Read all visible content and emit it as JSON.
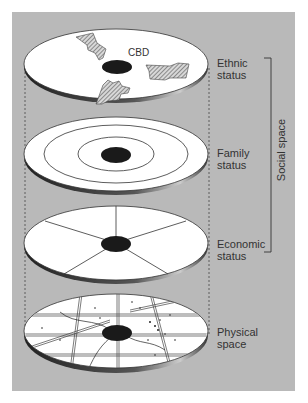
{
  "diagram": {
    "layers": [
      {
        "id": "ethnic",
        "label_line1": "Ethnic",
        "label_line2": "status",
        "center_label": "CBD"
      },
      {
        "id": "family",
        "label_line1": "Family",
        "label_line2": "status"
      },
      {
        "id": "economic",
        "label_line1": "Economic",
        "label_line2": "status"
      },
      {
        "id": "physical",
        "label_line1": "Physical",
        "label_line2": "space"
      }
    ],
    "bracket_label": "Social space",
    "colors": {
      "background": "#b9b9b9",
      "disc": "#ffffff",
      "cbd": "#1a1a1a",
      "line": "#333333"
    }
  }
}
